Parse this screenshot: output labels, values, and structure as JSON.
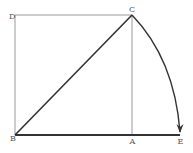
{
  "diagram": {
    "type": "geometric-construction",
    "points": {
      "D": {
        "label": "D",
        "x": 15,
        "y": 15
      },
      "C": {
        "label": "C",
        "x": 132,
        "y": 15
      },
      "B": {
        "label": "B",
        "x": 15,
        "y": 135
      },
      "A": {
        "label": "A",
        "x": 132,
        "y": 135
      },
      "E": {
        "label": "E",
        "x": 180,
        "y": 135
      }
    },
    "segments": [
      {
        "from": "D",
        "to": "C",
        "style": "thin"
      },
      {
        "from": "D",
        "to": "B",
        "style": "thin"
      },
      {
        "from": "A",
        "to": "C",
        "style": "thin"
      },
      {
        "from": "B",
        "to": "C",
        "style": "thick"
      },
      {
        "from": "B",
        "to": "E",
        "style": "thick"
      }
    ],
    "arc": {
      "from": "C",
      "to": "E",
      "center": "B",
      "arrow_at": "E"
    },
    "colors": {
      "thin_line": "#9a9a9a",
      "thick_line": "#333333",
      "label": "#555555",
      "background": "#ffffff"
    }
  }
}
